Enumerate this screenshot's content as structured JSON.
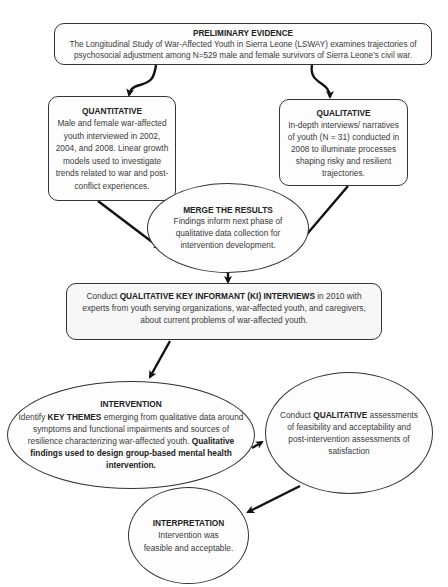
{
  "diagram": {
    "nodes": {
      "preliminary": {
        "title": "PRELIMINARY EVIDENCE",
        "text": "The Longitudinal Study of War-Affected Youth in Sierra Leone (LSWAY) examines trajectories of psychosocial adjustment among N=529 male and female survivors of Sierra Leone's civil war."
      },
      "quantitative": {
        "title": "QUANTITATIVE",
        "text": "Male and female war-affected youth interviewed in 2002, 2004, and 2008. Linear growth models used to investigate trends related to war and post-conflict experiences."
      },
      "qualitative": {
        "title": "QUALITATIVE",
        "text": "In-depth interviews/ narratives of youth (N = 31) conducted in 2008 to illuminate processes shaping risky and resilient trajectories."
      },
      "merge": {
        "title": "MERGE THE RESULTS",
        "text": "Findings inform next phase of qualitative data collection for intervention development."
      },
      "key_informant": {
        "prefix": "Conduct ",
        "bold": "QUALITATIVE KEY INFORMANT (KI) INTERVIEWS",
        "suffix": " in 2010 with experts from youth serving organizations, war-affected youth, and caregivers, about current problems of war-affected youth."
      },
      "intervention": {
        "title": "INTERVENTION",
        "prefix": "Identify ",
        "bold1": "KEY THEMES",
        "middle": " emerging from qualitative data around symptoms and functional impairments and sources of resilience characterizing war-affected youth.  ",
        "bold2": "Qualitative findings used to design group-based mental health intervention."
      },
      "qualitative_assessment": {
        "prefix": "Conduct ",
        "bold": "QUALITATIVE",
        "suffix": " assessments of feasibility and acceptability and post-intervention assessments of satisfaction"
      },
      "interpretation": {
        "title": "INTERPRETATION",
        "text": "Intervention was feasible and acceptable."
      }
    },
    "edges": [
      {
        "from": "preliminary",
        "to": "quantitative",
        "style": "curved"
      },
      {
        "from": "preliminary",
        "to": "qualitative",
        "style": "curved"
      },
      {
        "from": "quantitative",
        "to": "merge",
        "style": "straight"
      },
      {
        "from": "qualitative",
        "to": "merge",
        "style": "straight"
      },
      {
        "from": "merge",
        "to": "key_informant",
        "style": "straight"
      },
      {
        "from": "key_informant",
        "to": "intervention",
        "style": "straight"
      },
      {
        "from": "intervention",
        "to": "qualitative_assessment",
        "style": "straight"
      },
      {
        "from": "qualitative_assessment",
        "to": "interpretation",
        "style": "straight"
      }
    ],
    "colors": {
      "stroke": "#222222",
      "node_fill": "#fdfdfd",
      "ki_fill": "#f7f7f7",
      "text": "#3a3a3a"
    }
  }
}
